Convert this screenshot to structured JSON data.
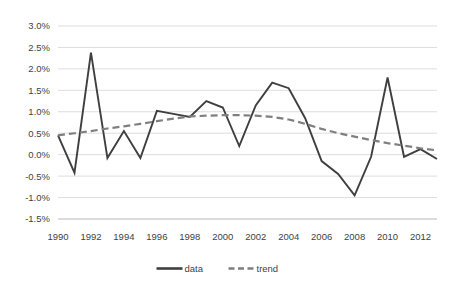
{
  "chart_data": {
    "type": "line",
    "title": "",
    "subtitle": "",
    "xlabel": "",
    "ylabel": "",
    "grid": true,
    "legend_position": "bottom",
    "x": [
      1990,
      1991,
      1992,
      1993,
      1994,
      1995,
      1996,
      1997,
      1998,
      1999,
      2000,
      2001,
      2002,
      2003,
      2004,
      2005,
      2006,
      2007,
      2008,
      2009,
      2010,
      2011,
      2012,
      2013
    ],
    "xlim": [
      1990,
      2013
    ],
    "ylim": [
      -1.5,
      3.0
    ],
    "y_tick_values": [
      3.0,
      2.5,
      2.0,
      1.5,
      1.0,
      0.5,
      0.0,
      -0.5,
      -1.0,
      -1.5
    ],
    "y_tick_labels": [
      "3.0%",
      "2.5%",
      "2.0%",
      "1.5%",
      "1.0%",
      "0.5%",
      "0.0%",
      "-0.5%",
      "-1.0%",
      "-1.5%"
    ],
    "x_tick_values": [
      1990,
      1992,
      1994,
      1996,
      1998,
      2000,
      2002,
      2004,
      2006,
      2008,
      2010,
      2012
    ],
    "x_tick_labels": [
      "1990",
      "1992",
      "1994",
      "1996",
      "1998",
      "2000",
      "2002",
      "2004",
      "2006",
      "2008",
      "2010",
      "2012"
    ],
    "series": [
      {
        "name": "data",
        "style": "solid",
        "color": "#3f3f3f",
        "values": [
          0.45,
          -0.42,
          2.38,
          -0.08,
          0.55,
          -0.08,
          1.02,
          0.95,
          0.88,
          1.25,
          1.1,
          0.2,
          1.15,
          1.68,
          1.55,
          0.85,
          -0.15,
          -0.45,
          -0.95,
          -0.05,
          1.8,
          -0.05,
          0.13,
          -0.1
        ]
      },
      {
        "name": "trend",
        "style": "dashed",
        "color": "#7f7f7f",
        "values": [
          0.45,
          0.5,
          0.55,
          0.61,
          0.66,
          0.72,
          0.78,
          0.84,
          0.89,
          0.91,
          0.92,
          0.92,
          0.91,
          0.88,
          0.82,
          0.72,
          0.6,
          0.5,
          0.42,
          0.34,
          0.27,
          0.21,
          0.15,
          0.1
        ]
      }
    ]
  },
  "legend": {
    "entries": [
      {
        "label": "data"
      },
      {
        "label": "trend"
      }
    ]
  }
}
